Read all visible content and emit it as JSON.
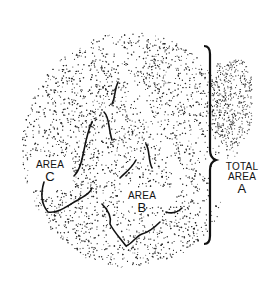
{
  "figure": {
    "labels": {
      "total_area": {
        "line1": "TOTAL",
        "line2": "AREA",
        "letter": "A"
      },
      "area_b": {
        "word": "AREA",
        "letter": "B"
      },
      "area_c": {
        "word": "AREA",
        "letter": "C"
      }
    },
    "bracket": {
      "side": "right",
      "spans": "top to bottom of region",
      "color": "#111111"
    },
    "colors": {
      "ink": "#111111",
      "background": "#ffffff"
    }
  }
}
